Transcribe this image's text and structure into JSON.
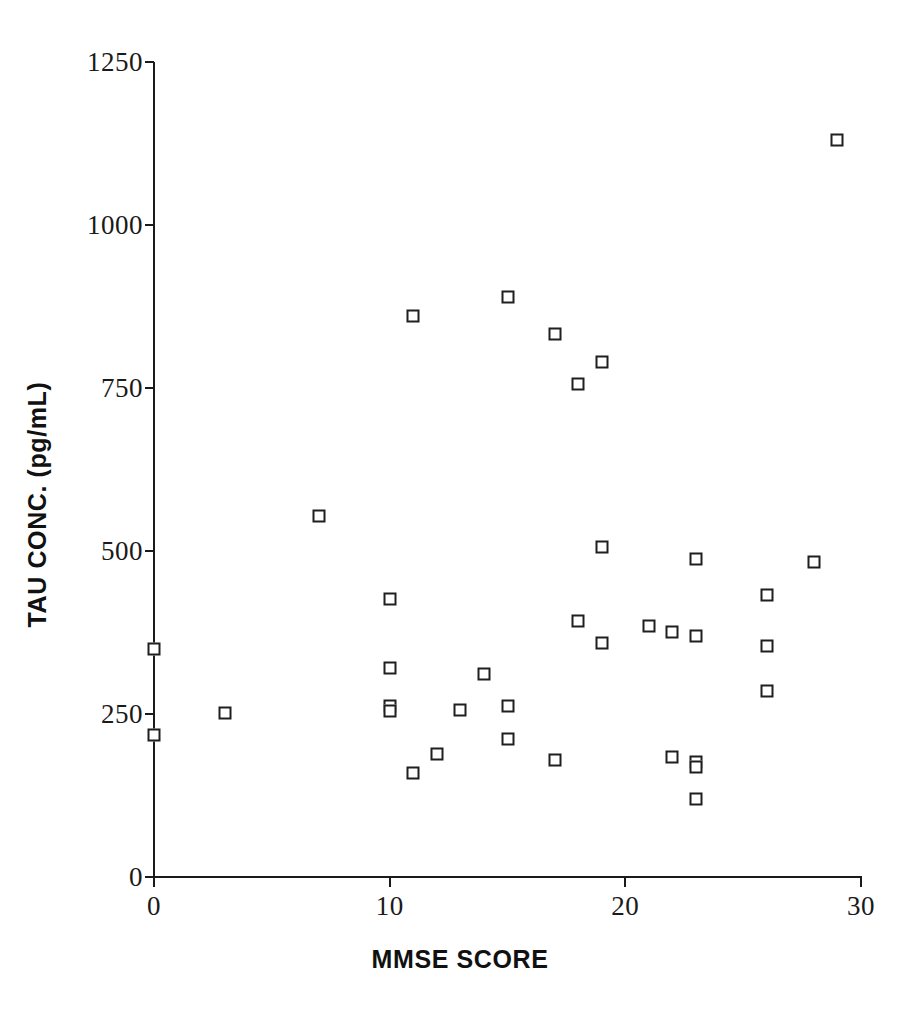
{
  "chart_data": {
    "type": "scatter",
    "title": "",
    "xlabel": "MMSE SCORE",
    "ylabel": "TAU CONC.  (pg/mL)",
    "xlim": [
      0,
      30
    ],
    "ylim": [
      0,
      1250
    ],
    "xticks": [
      0,
      10,
      20,
      30
    ],
    "yticks": [
      0,
      250,
      500,
      750,
      1000,
      1250
    ],
    "xtick_labels": [
      "0",
      "10",
      "20",
      "30"
    ],
    "ytick_labels": [
      "0",
      "250",
      "500",
      "750",
      "1000",
      "1250"
    ],
    "grid": false,
    "legend": null,
    "marker": "open-square",
    "marker_color": "#1f1f1f",
    "marker_fill": "#ffffff",
    "series": [
      {
        "name": "patients",
        "points": [
          {
            "x": 0,
            "y": 350
          },
          {
            "x": 0,
            "y": 218
          },
          {
            "x": 3,
            "y": 252
          },
          {
            "x": 7,
            "y": 553
          },
          {
            "x": 10,
            "y": 427
          },
          {
            "x": 10,
            "y": 320
          },
          {
            "x": 10,
            "y": 263
          },
          {
            "x": 10,
            "y": 254
          },
          {
            "x": 11,
            "y": 860
          },
          {
            "x": 11,
            "y": 160
          },
          {
            "x": 12,
            "y": 188
          },
          {
            "x": 13,
            "y": 256
          },
          {
            "x": 14,
            "y": 312
          },
          {
            "x": 15,
            "y": 890
          },
          {
            "x": 15,
            "y": 263
          },
          {
            "x": 15,
            "y": 211
          },
          {
            "x": 17,
            "y": 833
          },
          {
            "x": 17,
            "y": 180
          },
          {
            "x": 18,
            "y": 756
          },
          {
            "x": 18,
            "y": 393
          },
          {
            "x": 19,
            "y": 790
          },
          {
            "x": 19,
            "y": 506
          },
          {
            "x": 19,
            "y": 359
          },
          {
            "x": 21,
            "y": 385
          },
          {
            "x": 22,
            "y": 376
          },
          {
            "x": 22,
            "y": 184
          },
          {
            "x": 23,
            "y": 487
          },
          {
            "x": 23,
            "y": 369
          },
          {
            "x": 23,
            "y": 176
          },
          {
            "x": 23,
            "y": 168
          },
          {
            "x": 23,
            "y": 120
          },
          {
            "x": 26,
            "y": 432
          },
          {
            "x": 26,
            "y": 355
          },
          {
            "x": 26,
            "y": 286
          },
          {
            "x": 28,
            "y": 483
          },
          {
            "x": 29,
            "y": 1130
          }
        ]
      }
    ]
  }
}
